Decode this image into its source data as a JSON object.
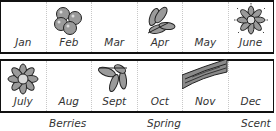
{
  "grid": {
    "row1": [
      {
        "month": "Jan",
        "icon": ""
      },
      {
        "month": "Feb",
        "icon": "berries-icon"
      },
      {
        "month": "Mar",
        "icon": ""
      },
      {
        "month": "Apr",
        "icon": "leaves-icon"
      },
      {
        "month": "May",
        "icon": ""
      },
      {
        "month": "June",
        "icon": "radiant-flower-icon"
      }
    ],
    "row2": [
      {
        "month": "July",
        "icon": "flower-icon"
      },
      {
        "month": "Aug",
        "icon": ""
      },
      {
        "month": "Sept",
        "icon": "leaves-icon"
      },
      {
        "month": "Oct",
        "icon": ""
      },
      {
        "month": "Nov",
        "icon": "bark-icon"
      },
      {
        "month": "Dec",
        "icon": ""
      }
    ]
  },
  "legend": {
    "berries": "Berries",
    "spring": "Spring",
    "scent": "Scent"
  },
  "colors": {
    "outline": "#111111",
    "icon_fill": "#9a9a9a",
    "grid": "#c8c8c8"
  }
}
